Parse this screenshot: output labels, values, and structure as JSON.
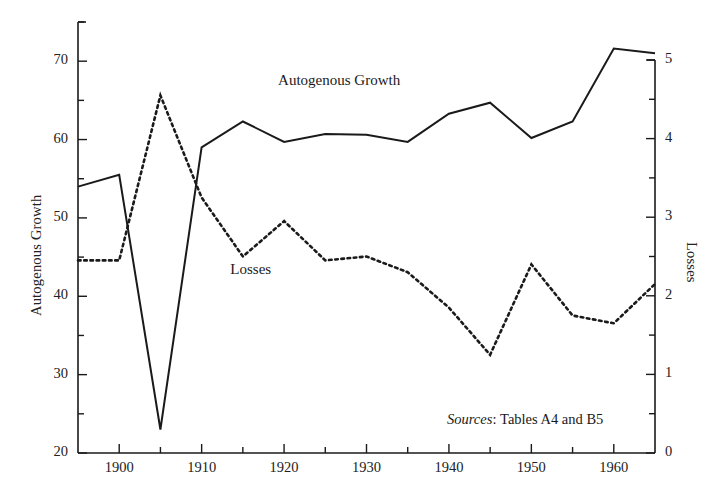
{
  "figure": {
    "left_axis_title": "Autogenous Growth",
    "right_axis_title": "Losses",
    "source_label": "Sources",
    "source_separator": ":",
    "source_text": "Tables A4 and B5",
    "line_color": "#1a1a1a",
    "background": "#ffffff"
  },
  "series_labels": {
    "autogenous_growth": "Autogenous Growth",
    "losses": "Losses"
  },
  "chart_data": {
    "type": "line",
    "title": "",
    "subtitle": "",
    "xlabel": "",
    "ylabel": "Autogenous Growth",
    "y2label": "Losses",
    "xlim": [
      1895,
      1965
    ],
    "ylim": [
      20,
      75
    ],
    "y2lim": [
      0,
      5
    ],
    "grid": false,
    "legend": "inline-annotations",
    "x_major_ticks": [
      1900,
      1910,
      1920,
      1930,
      1940,
      1950,
      1960
    ],
    "x_minor_ticks": [
      1895,
      1905,
      1915,
      1925,
      1935,
      1945,
      1955,
      1965
    ],
    "x_tick_labels": [
      "1900",
      "1910",
      "1920",
      "1930",
      "1940",
      "1950",
      "1960"
    ],
    "y_major_ticks": [
      20,
      30,
      40,
      50,
      60,
      70
    ],
    "y_minor_ticks": [
      25,
      35,
      45,
      55,
      65,
      75
    ],
    "y_tick_labels": [
      "20",
      "30",
      "40",
      "50",
      "60",
      "70"
    ],
    "y2_major_ticks": [
      0,
      1,
      2,
      3,
      4,
      5
    ],
    "y2_minor_ticks": [
      0.5,
      1.5,
      2.5,
      3.5,
      4.5
    ],
    "y2_tick_labels": [
      "0",
      "1",
      "2",
      "3",
      "4",
      "5"
    ],
    "x": [
      1895,
      1900,
      1905,
      1910,
      1915,
      1920,
      1925,
      1930,
      1935,
      1940,
      1945,
      1950,
      1955,
      1960,
      1965
    ],
    "series": [
      {
        "name": "Autogenous Growth",
        "axis": "left",
        "style": "solid",
        "values": [
          54.0,
          55.5,
          23.0,
          59.0,
          62.3,
          59.7,
          60.7,
          60.6,
          59.7,
          63.3,
          64.7,
          60.2,
          62.3,
          71.6,
          71.0
        ]
      },
      {
        "name": "Losses",
        "axis": "right",
        "style": "dotted",
        "values": [
          2.45,
          2.45,
          4.55,
          3.25,
          2.5,
          2.95,
          2.45,
          2.5,
          2.3,
          1.85,
          1.25,
          2.4,
          1.75,
          1.65,
          2.15
        ]
      }
    ],
    "annotations": [
      {
        "text": "Autogenous Growth",
        "x": 1925,
        "y": 66.5
      },
      {
        "text": "Losses",
        "x": 1916,
        "y": 42.5
      },
      {
        "text": "Sources: Tables A4 and B5",
        "x": 1950,
        "y": 26.5
      }
    ]
  }
}
